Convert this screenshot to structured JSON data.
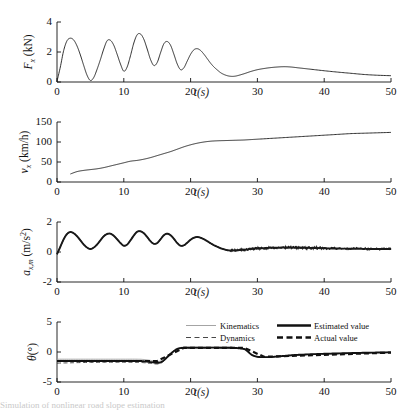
{
  "figure": {
    "background": "#ffffff",
    "line_color": "#1a1a1a",
    "shared_xlabel": "t(s)",
    "caption_fragment": "Simulation of nonlinear road slope estimation"
  },
  "chart_data": [
    {
      "type": "line",
      "id": "longitudinal-force",
      "title": "",
      "xlabel": "t(s)",
      "ylabel": "F_x (kN)",
      "ylabel_parts": {
        "symbol": "F",
        "subscript": "x",
        "unit": "(kN)"
      },
      "xlim": [
        0,
        50
      ],
      "ylim": [
        0,
        4
      ],
      "xticks": [
        0,
        10,
        20,
        30,
        40,
        50
      ],
      "yticks": [
        0,
        2,
        4
      ],
      "grid": false,
      "legend": null,
      "series": [
        {
          "name": "Longitudinal force",
          "style": "thin-solid",
          "x": [
            0,
            0.5,
            1,
            1.5,
            2,
            2.5,
            3,
            3.5,
            4,
            4.5,
            5,
            5.5,
            6,
            6.5,
            7,
            7.5,
            8,
            8.5,
            9,
            9.5,
            10,
            10.5,
            11,
            11.5,
            12,
            12.5,
            13,
            13.5,
            14,
            14.5,
            15,
            15.5,
            16,
            16.5,
            17,
            17.5,
            18,
            18.5,
            19,
            19.5,
            20,
            20.5,
            21,
            21.5,
            22,
            22.5,
            23,
            23.5,
            24,
            24.5,
            25,
            25.5,
            26,
            26.5,
            27,
            28,
            29,
            30,
            31,
            32,
            33,
            34,
            35,
            36,
            37,
            38,
            40,
            42,
            44,
            46,
            48,
            50
          ],
          "y": [
            0.05,
            1.0,
            2.1,
            2.75,
            2.92,
            2.8,
            2.4,
            1.8,
            1.1,
            0.45,
            0.1,
            0.3,
            0.85,
            1.5,
            2.2,
            2.75,
            2.78,
            2.45,
            1.85,
            1.2,
            0.72,
            1.0,
            1.75,
            2.6,
            3.15,
            3.2,
            2.85,
            2.2,
            1.5,
            1.1,
            1.3,
            1.95,
            2.55,
            2.7,
            2.45,
            1.85,
            1.2,
            0.82,
            0.95,
            1.4,
            1.85,
            2.15,
            2.22,
            2.1,
            1.85,
            1.55,
            1.25,
            1.0,
            0.8,
            0.62,
            0.5,
            0.42,
            0.38,
            0.38,
            0.42,
            0.55,
            0.7,
            0.82,
            0.9,
            0.96,
            1.0,
            1.02,
            1.0,
            0.95,
            0.9,
            0.85,
            0.75,
            0.66,
            0.58,
            0.5,
            0.45,
            0.42
          ]
        }
      ]
    },
    {
      "type": "line",
      "id": "longitudinal-velocity",
      "title": "",
      "xlabel": "t(s)",
      "ylabel": "v_x (km/h)",
      "ylabel_parts": {
        "symbol": "v",
        "subscript": "x",
        "unit": "(km/h)"
      },
      "xlim": [
        0,
        50
      ],
      "ylim": [
        0,
        150
      ],
      "xticks": [
        0,
        10,
        20,
        30,
        40,
        50
      ],
      "yticks": [
        0,
        50,
        100,
        150
      ],
      "grid": false,
      "legend": null,
      "series": [
        {
          "name": "Longitudinal velocity",
          "style": "thin-solid",
          "x": [
            2,
            3,
            4,
            5,
            6,
            7,
            8,
            9,
            10,
            11,
            12,
            13,
            14,
            15,
            16,
            17,
            18,
            19,
            20,
            21,
            22,
            23,
            24,
            25,
            26,
            27,
            28,
            29,
            30,
            32,
            34,
            36,
            38,
            40,
            42,
            44,
            46,
            48,
            50
          ],
          "y": [
            20,
            26,
            29,
            31,
            33,
            36,
            40,
            44,
            48,
            52,
            54,
            57,
            61,
            66,
            71,
            76,
            82,
            88,
            93,
            97,
            100,
            102,
            103,
            103.5,
            104,
            104.5,
            105,
            106,
            107,
            109,
            111,
            113,
            115,
            117,
            119,
            121,
            122,
            123,
            124
          ]
        }
      ]
    },
    {
      "type": "line",
      "id": "measured-acceleration",
      "title": "",
      "xlabel": "t(s)",
      "ylabel": "a_x,m (m/s^2)",
      "ylabel_parts": {
        "symbol": "a",
        "subscript": "x,m",
        "unit": "(m/s",
        "exponent": "2",
        "unit_close": ")"
      },
      "xlim": [
        0,
        50
      ],
      "ylim": [
        -2,
        2
      ],
      "xticks": [
        0,
        10,
        20,
        30,
        40,
        50
      ],
      "yticks": [
        -2,
        0,
        2
      ],
      "grid": false,
      "legend": null,
      "noisy_from_t": 26,
      "series": [
        {
          "name": "Measured acceleration",
          "style": "thick-noisy",
          "x": [
            0,
            0.5,
            1,
            1.5,
            2,
            2.5,
            3,
            3.5,
            4,
            4.5,
            5,
            5.5,
            6,
            6.5,
            7,
            7.5,
            8,
            8.5,
            9,
            9.5,
            10,
            10.5,
            11,
            11.5,
            12,
            12.5,
            13,
            13.5,
            14,
            14.5,
            15,
            15.5,
            16,
            16.5,
            17,
            17.5,
            18,
            18.5,
            19,
            19.5,
            20,
            20.5,
            21,
            21.5,
            22,
            22.5,
            23,
            23.5,
            24,
            24.5,
            25,
            25.5,
            26,
            27,
            28,
            29,
            30,
            31,
            32,
            33,
            34,
            35,
            36,
            37,
            38,
            39,
            40,
            42,
            44,
            46,
            48,
            50
          ],
          "y": [
            -0.15,
            0.35,
            0.85,
            1.2,
            1.33,
            1.25,
            1.05,
            0.78,
            0.5,
            0.3,
            0.2,
            0.3,
            0.5,
            0.78,
            1.05,
            1.2,
            1.22,
            1.08,
            0.85,
            0.6,
            0.42,
            0.5,
            0.78,
            1.1,
            1.35,
            1.38,
            1.25,
            1.0,
            0.72,
            0.55,
            0.6,
            0.85,
            1.12,
            1.22,
            1.12,
            0.88,
            0.6,
            0.42,
            0.45,
            0.62,
            0.82,
            0.95,
            1.0,
            0.95,
            0.85,
            0.72,
            0.58,
            0.45,
            0.35,
            0.25,
            0.18,
            0.12,
            0.1,
            0.12,
            0.15,
            0.2,
            0.24,
            0.26,
            0.28,
            0.29,
            0.3,
            0.3,
            0.29,
            0.28,
            0.27,
            0.26,
            0.25,
            0.23,
            0.22,
            0.21,
            0.2,
            0.2
          ]
        }
      ]
    },
    {
      "type": "line",
      "id": "road-slope-angle",
      "title": "",
      "xlabel": "t(s)",
      "ylabel": "θ(°)",
      "ylabel_parts": {
        "symbol": "θ",
        "unit": "(°)"
      },
      "xlim": [
        0,
        50
      ],
      "ylim": [
        -5,
        5
      ],
      "xticks": [
        0,
        10,
        20,
        30,
        40,
        50
      ],
      "yticks": [
        -5,
        0,
        5
      ],
      "grid": false,
      "legend": {
        "position": "top-right",
        "entries": [
          {
            "label": "Kinematics",
            "style": "thin-solid",
            "color": "#9a9a9a"
          },
          {
            "label": "Estimated value",
            "style": "thick-solid",
            "color": "#111111"
          },
          {
            "label": "Dynamics",
            "style": "thin-dashed",
            "color": "#333333"
          },
          {
            "label": "Actual value",
            "style": "thick-dashed",
            "color": "#111111"
          }
        ]
      },
      "series": [
        {
          "name": "Kinematics",
          "style": "thin-solid",
          "x": [
            0,
            2,
            4,
            6,
            8,
            10,
            12,
            13,
            14,
            15,
            15.5,
            16,
            16.5,
            17,
            17.5,
            18,
            18.5,
            19,
            20,
            22,
            24,
            26,
            27,
            28,
            28.5,
            29,
            29.5,
            30,
            30.5,
            31,
            32,
            33,
            34,
            35,
            36,
            38,
            40,
            42,
            44,
            46,
            48,
            50
          ],
          "y": [
            -1.2,
            -1.2,
            -1.2,
            -1.2,
            -1.2,
            -1.2,
            -1.2,
            -1.25,
            -1.4,
            -1.55,
            -1.5,
            -1.2,
            -0.7,
            -0.2,
            0.25,
            0.6,
            0.75,
            0.8,
            0.8,
            0.8,
            0.8,
            0.78,
            0.72,
            0.55,
            0.2,
            -0.3,
            -0.6,
            -0.75,
            -0.8,
            -0.82,
            -0.8,
            -0.72,
            -0.62,
            -0.52,
            -0.45,
            -0.35,
            -0.28,
            -0.22,
            -0.16,
            -0.12,
            -0.08,
            -0.05
          ]
        },
        {
          "name": "Dynamics",
          "style": "thin-dashed",
          "x": [
            0,
            2,
            4,
            6,
            8,
            10,
            12,
            13,
            14,
            15,
            15.5,
            16,
            16.5,
            17,
            17.5,
            18,
            18.5,
            19,
            20,
            22,
            24,
            26,
            27,
            28,
            28.5,
            29,
            29.5,
            30,
            30.5,
            31,
            32,
            33,
            34,
            35,
            36,
            38,
            40,
            42,
            44,
            46,
            48,
            50
          ],
          "y": [
            -1.85,
            -1.8,
            -1.75,
            -1.72,
            -1.7,
            -1.7,
            -1.72,
            -1.78,
            -1.9,
            -2.0,
            -1.9,
            -1.5,
            -0.95,
            -0.4,
            0.1,
            0.45,
            0.6,
            0.65,
            0.68,
            0.7,
            0.7,
            0.68,
            0.62,
            0.45,
            0.1,
            -0.4,
            -0.7,
            -0.85,
            -0.9,
            -0.92,
            -0.88,
            -0.8,
            -0.7,
            -0.6,
            -0.52,
            -0.42,
            -0.34,
            -0.27,
            -0.2,
            -0.15,
            -0.1,
            -0.06
          ]
        },
        {
          "name": "Estimated value",
          "style": "thick-solid",
          "x": [
            0,
            2,
            4,
            6,
            8,
            10,
            12,
            13,
            14,
            15,
            15.5,
            16,
            16.5,
            17,
            17.5,
            18,
            18.5,
            19,
            20,
            22,
            24,
            26,
            27,
            28,
            28.5,
            29,
            29.5,
            30,
            30.5,
            31,
            32,
            33,
            34,
            35,
            36,
            38,
            40,
            42,
            44,
            46,
            48,
            50
          ],
          "y": [
            -1.5,
            -1.5,
            -1.5,
            -1.5,
            -1.5,
            -1.5,
            -1.5,
            -1.55,
            -1.68,
            -1.8,
            -1.72,
            -1.38,
            -0.85,
            -0.32,
            0.15,
            0.5,
            0.65,
            0.7,
            0.72,
            0.72,
            0.72,
            0.7,
            0.65,
            0.5,
            0.15,
            -0.35,
            -0.65,
            -0.8,
            -0.85,
            -0.86,
            -0.83,
            -0.75,
            -0.65,
            -0.56,
            -0.48,
            -0.38,
            -0.3,
            -0.24,
            -0.18,
            -0.13,
            -0.09,
            -0.06
          ]
        },
        {
          "name": "Actual value",
          "style": "thick-dashed",
          "x": [
            0,
            15,
            15.01,
            19,
            19.01,
            28,
            28.01,
            31,
            31.01,
            50
          ],
          "y": [
            -1.5,
            -1.5,
            -1.5,
            0.7,
            0.7,
            0.7,
            0.7,
            -0.8,
            -0.8,
            -0.1
          ]
        }
      ]
    }
  ]
}
